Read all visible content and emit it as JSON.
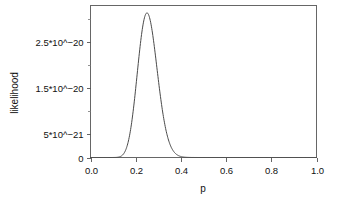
{
  "chart_data": {
    "type": "line",
    "title": "",
    "xlabel": "p",
    "ylabel": "likelihood",
    "xlim": [
      0.0,
      1.0
    ],
    "ylim": [
      0.0,
      3.3e-20
    ],
    "grid": false,
    "legend": null,
    "x_ticks": [
      {
        "value": 0.0,
        "label": "0.0"
      },
      {
        "value": 0.2,
        "label": "0.2"
      },
      {
        "value": 0.4,
        "label": "0.4"
      },
      {
        "value": 0.6,
        "label": "0.6"
      },
      {
        "value": 0.8,
        "label": "0.8"
      },
      {
        "value": 1.0,
        "label": "1.0"
      }
    ],
    "y_ticks": [
      {
        "value": 0.0,
        "label": "0"
      },
      {
        "value": 5e-21,
        "label": "5*10^−21"
      },
      {
        "value": 1.5e-20,
        "label": "1.5*10^−20"
      },
      {
        "value": 2.5e-20,
        "label": "2.5*10^−20"
      }
    ],
    "y_minor_ticks": [
      1e-20,
      2e-20,
      3e-20
    ],
    "series": [
      {
        "name": "likelihood",
        "color": "#4a4a4a",
        "peak_x": 0.25,
        "peak_y": 3.14e-20,
        "x": [
          0.0,
          0.02,
          0.04,
          0.06,
          0.08,
          0.1,
          0.11,
          0.12,
          0.13,
          0.14,
          0.15,
          0.16,
          0.17,
          0.18,
          0.19,
          0.2,
          0.21,
          0.22,
          0.23,
          0.24,
          0.25,
          0.26,
          0.27,
          0.28,
          0.29,
          0.3,
          0.31,
          0.32,
          0.33,
          0.34,
          0.35,
          0.36,
          0.37,
          0.38,
          0.39,
          0.4,
          0.42,
          0.44,
          0.46,
          0.48,
          0.5,
          0.55,
          0.6,
          0.65,
          0.7,
          0.75,
          0.8,
          0.85,
          0.9,
          0.95,
          1.0
        ],
        "y": [
          0.0,
          0.0,
          0.0,
          1e-26,
          2.2e-24,
          1.1e-22,
          4.8e-22,
          1.7e-21,
          5e-21,
          1.27e-20,
          2.78e-20,
          3.1e-20,
          3.1e-20,
          3.1e-20,
          3.1e-20,
          1.4e-20,
          1.85e-20,
          2.3e-20,
          2.7e-20,
          3e-20,
          3.14e-20,
          3.07e-20,
          2.82e-20,
          2.42e-20,
          1.95e-20,
          1.48e-20,
          1.06e-20,
          7.2e-21,
          4.6e-21,
          2.8e-21,
          1.6e-21,
          8.6e-22,
          4.4e-22,
          2.2e-22,
          1e-22,
          4.5e-23,
          8e-24,
          1.2e-24,
          1.6e-25,
          1.8e-26,
          1.8e-27,
          0.0,
          0.0,
          0.0,
          0.0,
          0.0,
          0.0,
          0.0,
          0.0,
          0.0,
          0.0
        ]
      }
    ],
    "distribution_model": {
      "family": "binomial-likelihood",
      "successes": 25,
      "trials": 100,
      "formula": "L(p) = C(n,k) * p^k * (1-p)^(n-k)"
    }
  }
}
